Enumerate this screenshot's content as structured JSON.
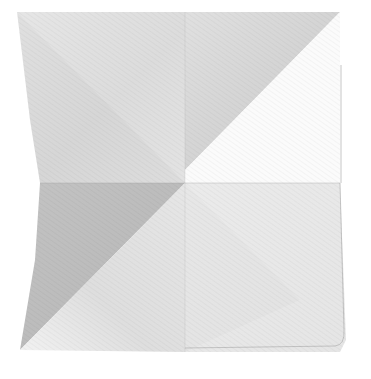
{
  "image": {
    "subject": "Folded white cloth napkin photographed from above on a white background",
    "caption": "Folded white napkin with diagonal crease lines",
    "colors": {
      "background": "#ffffff",
      "cloth_light": "#e9e9e9",
      "cloth_mid": "#d8d8d8",
      "cloth_shadow": "#bdbdbd",
      "cloth_highlight": "#f7f7f7",
      "seam": "#a9a9a9"
    }
  }
}
